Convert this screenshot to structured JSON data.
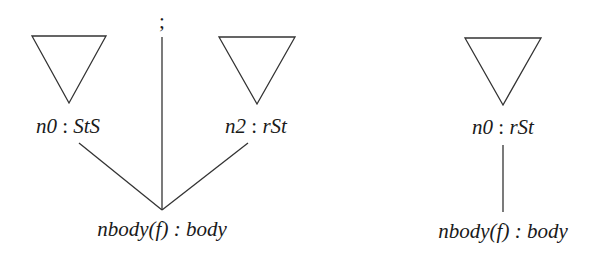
{
  "diagram": {
    "left_tree": {
      "separator": ";",
      "children": [
        {
          "name": "n0",
          "sep": " : ",
          "type": "StS"
        },
        {
          "name": "n2",
          "sep": " : ",
          "type": "rSt"
        }
      ],
      "root": {
        "label": "nbody(f) : body"
      }
    },
    "right_tree": {
      "child": {
        "name": "n0",
        "sep": " : ",
        "type": "rSt"
      },
      "root": {
        "label": "nbody(f) : body"
      }
    }
  }
}
